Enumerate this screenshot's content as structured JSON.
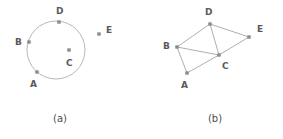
{
  "figure": {
    "width": 283,
    "height": 139,
    "background": "#ffffff",
    "marker_color": "#8c8c8c",
    "line_color": "#a6a6a6",
    "circle_color": "#b0b0b0",
    "label_color": "#5a5a5a",
    "caption_color": "#4d4d4d"
  },
  "panels": [
    {
      "id": "panel-a",
      "caption": "(a)",
      "caption_pos": {
        "x": 60,
        "y": 122
      },
      "type": "points-on-circle",
      "circle": {
        "cx": 56,
        "cy": 50,
        "r": 29
      },
      "points": [
        {
          "name": "A",
          "x": 37,
          "y": 72,
          "label_x": 30,
          "label_y": 87
        },
        {
          "name": "B",
          "x": 29,
          "y": 42,
          "label_x": 15,
          "label_y": 45
        },
        {
          "name": "C",
          "x": 69,
          "y": 50,
          "label_x": 66,
          "label_y": 66
        },
        {
          "name": "D",
          "x": 59,
          "y": 22,
          "label_x": 56,
          "label_y": 14
        },
        {
          "name": "E",
          "x": 99,
          "y": 34,
          "label_x": 106,
          "label_y": 33
        }
      ],
      "edges": []
    },
    {
      "id": "panel-b",
      "caption": "(b)",
      "caption_pos": {
        "x": 215,
        "y": 122
      },
      "type": "graph",
      "circle": null,
      "points": [
        {
          "name": "A",
          "x": 187,
          "y": 73,
          "label_x": 181,
          "label_y": 88
        },
        {
          "name": "B",
          "x": 177,
          "y": 47,
          "label_x": 163,
          "label_y": 49
        },
        {
          "name": "C",
          "x": 219,
          "y": 55,
          "label_x": 222,
          "label_y": 69
        },
        {
          "name": "D",
          "x": 210,
          "y": 24,
          "label_x": 205,
          "label_y": 15
        },
        {
          "name": "E",
          "x": 249,
          "y": 37,
          "label_x": 257,
          "label_y": 32
        }
      ],
      "edges": [
        {
          "from": "B",
          "to": "D"
        },
        {
          "from": "B",
          "to": "C"
        },
        {
          "from": "B",
          "to": "A"
        },
        {
          "from": "A",
          "to": "C"
        },
        {
          "from": "C",
          "to": "D"
        },
        {
          "from": "C",
          "to": "E"
        },
        {
          "from": "D",
          "to": "E"
        }
      ]
    }
  ]
}
